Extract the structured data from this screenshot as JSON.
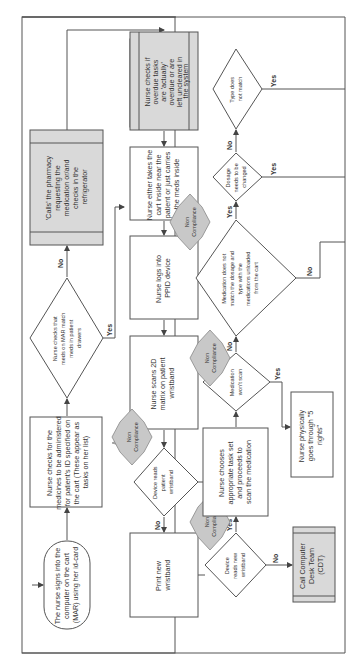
{
  "diagram": {
    "type": "flowchart",
    "orientation": "rotated-90-ccw",
    "nodes": {
      "start": {
        "shape": "terminator",
        "lines": [
          "The nurse signs into the",
          "computer on the cart",
          "(MAR) using her id-card"
        ]
      },
      "check_medicines": {
        "shape": "process",
        "lines": [
          "Nurse checks for the",
          "medicines to be administered",
          "for patient's ID specified on",
          "the cart (These appear as",
          "tasks on her list)"
        ]
      },
      "check_meds_match": {
        "shape": "decision",
        "lines": [
          "Nurse checks that",
          "meds on MAR match",
          "meds in patient",
          "drawers"
        ]
      },
      "call_pharmacy": {
        "shape": "predefined",
        "lines": [
          "'Calls' the pharmacy",
          "requesting the",
          "medication or/and",
          "checks in the",
          "refrigerator"
        ]
      },
      "check_overdue": {
        "shape": "predefined",
        "lines": [
          "Nurse checks if",
          "overdue tasks",
          "are 'actually'",
          "overdue or are",
          "left uncleared in",
          "the system"
        ]
      },
      "take_cart": {
        "shape": "process",
        "lines": [
          "Nurse either takes the",
          "cart inside near the",
          "patient or just carries",
          "the meds inside"
        ]
      },
      "log_ppid": {
        "shape": "process",
        "lines": [
          "Nurse logs into",
          "PPID device"
        ]
      },
      "scan_2d": {
        "shape": "process",
        "lines": [
          "Nurse scans 2D",
          "matrix on patient",
          "wristband"
        ]
      },
      "device_reads_patient": {
        "shape": "decision",
        "lines": [
          "Device reads",
          "patient",
          "wristband"
        ]
      },
      "print_wristband": {
        "shape": "process",
        "lines": [
          "Print new",
          "wristband"
        ]
      },
      "device_reads_new": {
        "shape": "decision",
        "lines": [
          "Device",
          "reads new",
          "wristband"
        ]
      },
      "call_cdt": {
        "shape": "predefined",
        "lines": [
          "Call Computer",
          "Desk Team",
          "(CDT)"
        ]
      },
      "choose_task": {
        "shape": "process",
        "lines": [
          "Nurse chooses",
          "appropriate task set",
          "and proceeds to",
          "scan the medication"
        ]
      },
      "med_wont_scan": {
        "shape": "decision",
        "lines": [
          "Medication",
          "won't scan"
        ]
      },
      "five_rights": {
        "shape": "process",
        "lines": [
          "Nurse physically",
          "goes through \"5",
          "rights\""
        ]
      },
      "med_not_match": {
        "shape": "decision",
        "lines": [
          "Medication does not",
          "match the dosage and",
          "type with the",
          "medications unloaded",
          "from the cart"
        ]
      },
      "dosage_change": {
        "shape": "decision",
        "lines": [
          "Dosage",
          "needs to be",
          "changed"
        ]
      },
      "type_not_match": {
        "shape": "decision",
        "lines": [
          "Type does",
          "not match"
        ]
      }
    },
    "non_compliance_badges": [
      {
        "near": "device_reads_patient",
        "lines": [
          "Non",
          "Compliance"
        ]
      },
      {
        "near": "device_reads_new",
        "lines": [
          "Non",
          "Compliance"
        ]
      },
      {
        "near": "med_wont_scan",
        "lines": [
          "Non",
          "Compliance"
        ]
      },
      {
        "near": "med_not_match",
        "lines": [
          "Non",
          "Compliance"
        ]
      }
    ],
    "edge_labels": {
      "yes": "Yes",
      "no": "No"
    },
    "colors": {
      "box_fill": "#ffffff",
      "predefined_fill": "#d9d9d9",
      "badge_fill": "#c8c8c8",
      "stroke": "#555555"
    }
  }
}
